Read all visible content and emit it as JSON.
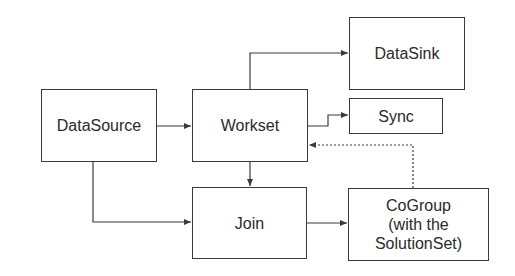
{
  "diagram": {
    "nodes": [
      {
        "id": "datasource",
        "label": "DataSource"
      },
      {
        "id": "workset",
        "label": "Workset"
      },
      {
        "id": "datasink",
        "label": "DataSink"
      },
      {
        "id": "sync",
        "label": "Sync"
      },
      {
        "id": "join",
        "label": "Join"
      },
      {
        "id": "cogroup",
        "label_lines": [
          "CoGroup",
          "(with the",
          "SolutionSet)"
        ]
      }
    ],
    "edges": [
      {
        "from": "datasource",
        "to": "workset",
        "style": "solid"
      },
      {
        "from": "workset",
        "to": "datasink",
        "style": "solid"
      },
      {
        "from": "workset",
        "to": "sync",
        "style": "solid"
      },
      {
        "from": "workset",
        "to": "join",
        "style": "solid"
      },
      {
        "from": "datasource",
        "to": "join",
        "style": "solid"
      },
      {
        "from": "join",
        "to": "cogroup",
        "style": "solid"
      },
      {
        "from": "cogroup",
        "to": "workset",
        "style": "dashed"
      }
    ],
    "colors": {
      "stroke": "#3a3a3a",
      "background": "#ffffff",
      "text": "#2a2a2a"
    }
  }
}
